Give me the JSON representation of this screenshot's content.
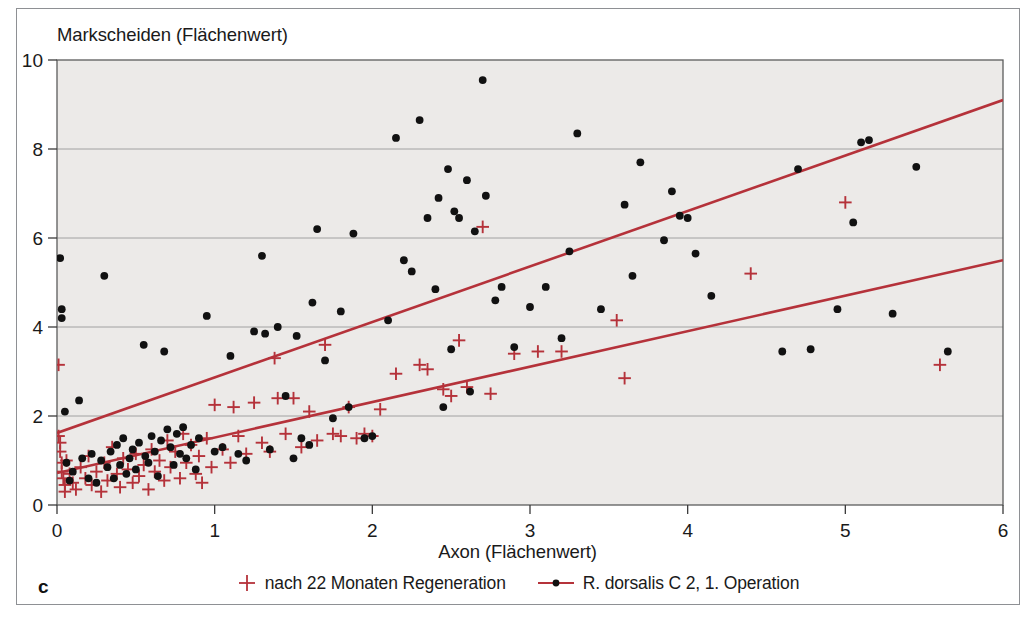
{
  "figure": {
    "panel_label": "c",
    "background_color": "#ffffff",
    "plot_background_color": "#eceae8",
    "frame_color": "#8e9094",
    "grid_color": "#9a9a9a",
    "accent_red": "#b5323a",
    "marker_black": "#111111"
  },
  "legend": {
    "position": "bottom-center",
    "entries": [
      {
        "marker": "plus-icon",
        "color": "#b5323a",
        "label": "nach 22 Monaten Regeneration"
      },
      {
        "marker": "line-with-dot-icon",
        "color": "#b5323a",
        "label": "R. dorsalis C 2, 1. Operation"
      }
    ]
  },
  "chart_data": {
    "type": "scatter",
    "title": "",
    "xlabel": "Axon (Flächenwert)",
    "ylabel": "Markscheiden (Flächenwert)",
    "xlim": [
      0,
      6
    ],
    "ylim": [
      0,
      10
    ],
    "xticks": [
      0,
      1,
      2,
      3,
      4,
      5,
      6
    ],
    "yticks": [
      0,
      2,
      4,
      6,
      8,
      10
    ],
    "xtick_labels": [
      "0",
      "1",
      "2",
      "3",
      "4",
      "5",
      "6"
    ],
    "ytick_labels": [
      "0",
      "2",
      "4",
      "6",
      "8",
      "10"
    ],
    "grid": {
      "horizontal": true,
      "vertical": false,
      "values": [
        2,
        4,
        6,
        8
      ]
    },
    "series": [
      {
        "name": "R. dorsalis C 2, 1. Operation",
        "marker": "dot",
        "color": "#111111",
        "points": [
          [
            0.02,
            5.55
          ],
          [
            0.03,
            4.4
          ],
          [
            0.03,
            4.2
          ],
          [
            0.05,
            2.1
          ],
          [
            0.06,
            0.95
          ],
          [
            0.08,
            0.55
          ],
          [
            0.1,
            0.75
          ],
          [
            0.14,
            2.35
          ],
          [
            0.16,
            1.05
          ],
          [
            0.2,
            0.6
          ],
          [
            0.22,
            1.15
          ],
          [
            0.25,
            0.5
          ],
          [
            0.28,
            1.0
          ],
          [
            0.3,
            5.15
          ],
          [
            0.32,
            0.85
          ],
          [
            0.34,
            1.2
          ],
          [
            0.36,
            0.6
          ],
          [
            0.38,
            1.35
          ],
          [
            0.4,
            0.9
          ],
          [
            0.42,
            1.5
          ],
          [
            0.44,
            0.7
          ],
          [
            0.46,
            1.05
          ],
          [
            0.48,
            1.25
          ],
          [
            0.5,
            0.8
          ],
          [
            0.52,
            1.4
          ],
          [
            0.55,
            3.6
          ],
          [
            0.56,
            1.1
          ],
          [
            0.58,
            0.95
          ],
          [
            0.6,
            1.55
          ],
          [
            0.62,
            1.2
          ],
          [
            0.64,
            0.65
          ],
          [
            0.66,
            1.45
          ],
          [
            0.68,
            3.45
          ],
          [
            0.7,
            1.7
          ],
          [
            0.72,
            1.3
          ],
          [
            0.74,
            0.9
          ],
          [
            0.76,
            1.6
          ],
          [
            0.78,
            1.15
          ],
          [
            0.8,
            1.75
          ],
          [
            0.82,
            1.05
          ],
          [
            0.85,
            1.35
          ],
          [
            0.88,
            0.8
          ],
          [
            0.9,
            1.5
          ],
          [
            0.95,
            4.25
          ],
          [
            1.0,
            1.2
          ],
          [
            1.05,
            1.3
          ],
          [
            1.1,
            3.35
          ],
          [
            1.15,
            1.15
          ],
          [
            1.2,
            1.0
          ],
          [
            1.25,
            3.9
          ],
          [
            1.3,
            5.6
          ],
          [
            1.32,
            3.85
          ],
          [
            1.35,
            1.25
          ],
          [
            1.4,
            4.0
          ],
          [
            1.45,
            2.45
          ],
          [
            1.5,
            1.05
          ],
          [
            1.52,
            3.8
          ],
          [
            1.55,
            1.5
          ],
          [
            1.6,
            1.35
          ],
          [
            1.62,
            4.55
          ],
          [
            1.65,
            6.2
          ],
          [
            1.7,
            3.25
          ],
          [
            1.75,
            1.95
          ],
          [
            1.8,
            4.35
          ],
          [
            1.85,
            2.2
          ],
          [
            1.88,
            6.1
          ],
          [
            1.95,
            1.5
          ],
          [
            2.0,
            1.55
          ],
          [
            2.1,
            4.15
          ],
          [
            2.15,
            8.25
          ],
          [
            2.2,
            5.5
          ],
          [
            2.25,
            5.25
          ],
          [
            2.3,
            8.65
          ],
          [
            2.35,
            6.45
          ],
          [
            2.4,
            4.85
          ],
          [
            2.42,
            6.9
          ],
          [
            2.45,
            2.2
          ],
          [
            2.48,
            7.55
          ],
          [
            2.5,
            3.5
          ],
          [
            2.52,
            6.6
          ],
          [
            2.55,
            6.45
          ],
          [
            2.6,
            7.3
          ],
          [
            2.62,
            2.55
          ],
          [
            2.65,
            6.15
          ],
          [
            2.7,
            9.55
          ],
          [
            2.72,
            6.95
          ],
          [
            2.78,
            4.6
          ],
          [
            2.82,
            4.9
          ],
          [
            2.9,
            3.55
          ],
          [
            3.0,
            4.45
          ],
          [
            3.1,
            4.9
          ],
          [
            3.2,
            3.75
          ],
          [
            3.25,
            5.7
          ],
          [
            3.3,
            8.35
          ],
          [
            3.45,
            4.4
          ],
          [
            3.6,
            6.75
          ],
          [
            3.65,
            5.15
          ],
          [
            3.7,
            7.7
          ],
          [
            3.85,
            5.95
          ],
          [
            3.9,
            7.05
          ],
          [
            3.95,
            6.5
          ],
          [
            4.0,
            6.45
          ],
          [
            4.05,
            5.65
          ],
          [
            4.15,
            4.7
          ],
          [
            4.6,
            3.45
          ],
          [
            4.7,
            7.55
          ],
          [
            4.78,
            3.5
          ],
          [
            4.95,
            4.4
          ],
          [
            5.05,
            6.35
          ],
          [
            5.1,
            8.15
          ],
          [
            5.15,
            8.2
          ],
          [
            5.3,
            4.3
          ],
          [
            5.45,
            7.6
          ],
          [
            5.65,
            3.45
          ]
        ]
      },
      {
        "name": "nach 22 Monaten Regeneration",
        "marker": "plus",
        "color": "#b5323a",
        "points": [
          [
            0.01,
            3.15
          ],
          [
            0.01,
            1.55
          ],
          [
            0.02,
            1.4
          ],
          [
            0.02,
            1.2
          ],
          [
            0.03,
            0.95
          ],
          [
            0.03,
            0.75
          ],
          [
            0.04,
            0.6
          ],
          [
            0.05,
            0.45
          ],
          [
            0.05,
            0.3
          ],
          [
            0.06,
            1.0
          ],
          [
            0.08,
            0.7
          ],
          [
            0.1,
            0.5
          ],
          [
            0.12,
            0.35
          ],
          [
            0.15,
            0.85
          ],
          [
            0.18,
            0.6
          ],
          [
            0.2,
            1.1
          ],
          [
            0.22,
            0.45
          ],
          [
            0.25,
            0.75
          ],
          [
            0.28,
            0.3
          ],
          [
            0.3,
            0.95
          ],
          [
            0.32,
            0.55
          ],
          [
            0.35,
            1.3
          ],
          [
            0.38,
            0.7
          ],
          [
            0.4,
            0.4
          ],
          [
            0.42,
            1.05
          ],
          [
            0.45,
            0.8
          ],
          [
            0.48,
            0.5
          ],
          [
            0.5,
            1.15
          ],
          [
            0.52,
            0.65
          ],
          [
            0.55,
            0.9
          ],
          [
            0.58,
            0.35
          ],
          [
            0.6,
            1.25
          ],
          [
            0.62,
            0.75
          ],
          [
            0.65,
            1.0
          ],
          [
            0.68,
            0.55
          ],
          [
            0.7,
            1.45
          ],
          [
            0.72,
            0.85
          ],
          [
            0.75,
            1.2
          ],
          [
            0.78,
            0.6
          ],
          [
            0.8,
            1.6
          ],
          [
            0.82,
            0.95
          ],
          [
            0.85,
            1.35
          ],
          [
            0.88,
            0.7
          ],
          [
            0.9,
            1.1
          ],
          [
            0.92,
            0.5
          ],
          [
            0.95,
            1.5
          ],
          [
            0.98,
            0.85
          ],
          [
            1.0,
            2.25
          ],
          [
            1.05,
            1.25
          ],
          [
            1.1,
            0.95
          ],
          [
            1.12,
            2.2
          ],
          [
            1.15,
            1.55
          ],
          [
            1.2,
            1.15
          ],
          [
            1.25,
            2.3
          ],
          [
            1.3,
            1.4
          ],
          [
            1.35,
            1.2
          ],
          [
            1.38,
            3.3
          ],
          [
            1.4,
            2.4
          ],
          [
            1.45,
            1.6
          ],
          [
            1.5,
            2.4
          ],
          [
            1.55,
            1.3
          ],
          [
            1.6,
            2.1
          ],
          [
            1.65,
            1.45
          ],
          [
            1.7,
            3.6
          ],
          [
            1.75,
            1.6
          ],
          [
            1.8,
            1.55
          ],
          [
            1.85,
            2.2
          ],
          [
            1.9,
            1.5
          ],
          [
            1.95,
            1.6
          ],
          [
            2.0,
            1.55
          ],
          [
            2.05,
            2.15
          ],
          [
            2.15,
            2.95
          ],
          [
            2.3,
            3.15
          ],
          [
            2.35,
            3.05
          ],
          [
            2.45,
            2.6
          ],
          [
            2.5,
            2.45
          ],
          [
            2.55,
            3.7
          ],
          [
            2.6,
            2.65
          ],
          [
            2.7,
            6.25
          ],
          [
            2.75,
            2.5
          ],
          [
            2.9,
            3.4
          ],
          [
            3.05,
            3.45
          ],
          [
            3.2,
            3.45
          ],
          [
            3.55,
            4.15
          ],
          [
            3.6,
            2.85
          ],
          [
            4.4,
            5.2
          ],
          [
            5.0,
            6.8
          ],
          [
            5.6,
            3.15
          ]
        ]
      }
    ],
    "regression_lines": [
      {
        "name": "upper-regression-line",
        "color": "#b5323a",
        "x0": 0,
        "y0": 1.62,
        "x1": 6,
        "y1": 9.1
      },
      {
        "name": "lower-regression-line",
        "color": "#b5323a",
        "x0": 0,
        "y0": 0.72,
        "x1": 6,
        "y1": 5.5
      }
    ]
  }
}
